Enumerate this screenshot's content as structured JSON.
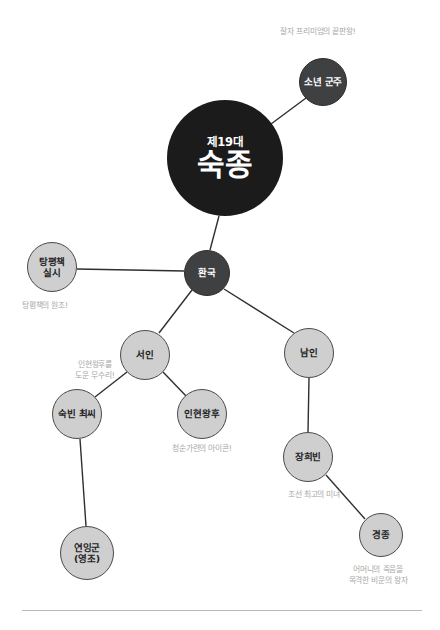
{
  "diagram": {
    "type": "mind-map",
    "colors": {
      "root_fill": "#1b1b1b",
      "dark_fill": "#3f4041",
      "light_fill": "#cfcfcf",
      "edge_stroke": "#2f2f2f",
      "annotation_text": "#a8a8a8",
      "rule": "#b9b9b9"
    },
    "root": {
      "generation_label": "제19대",
      "name_label": "숙종"
    },
    "nodes": [
      {
        "id": "sonyeon-gunju",
        "label": "소년 군주",
        "style": "dark",
        "cx": 323,
        "cy": 82,
        "r": 24
      },
      {
        "id": "sukjong",
        "label": "제19대 숙종",
        "style": "root",
        "cx": 225,
        "cy": 158,
        "r": 58
      },
      {
        "id": "hwanguk",
        "label": "환국",
        "style": "dark",
        "cx": 207,
        "cy": 273,
        "r": 23
      },
      {
        "id": "tangpyeong",
        "label": "탕평책\n실시",
        "style": "light",
        "cx": 52,
        "cy": 267,
        "r": 25
      },
      {
        "id": "seoin",
        "label": "서인",
        "style": "light",
        "cx": 145,
        "cy": 355,
        "r": 25
      },
      {
        "id": "namin",
        "label": "남인",
        "style": "light",
        "cx": 309,
        "cy": 353,
        "r": 25
      },
      {
        "id": "sukbin-choe",
        "label": "숙빈 최씨",
        "style": "light",
        "cx": 77,
        "cy": 414,
        "r": 25
      },
      {
        "id": "inhyeon",
        "label": "인현왕후",
        "style": "light",
        "cx": 202,
        "cy": 414,
        "r": 25
      },
      {
        "id": "janghuibin",
        "label": "장희빈",
        "style": "light",
        "cx": 308,
        "cy": 457,
        "r": 25
      },
      {
        "id": "gyeongjong",
        "label": "경종",
        "style": "light",
        "cx": 381,
        "cy": 535,
        "r": 22
      },
      {
        "id": "yeoninggun",
        "label": "연잉군\n(영조)",
        "style": "light",
        "cx": 87,
        "cy": 553,
        "r": 27
      }
    ],
    "edges": [
      {
        "id": "edge-sukjong-sonyeon",
        "from": "sukjong",
        "to": "sonyeon-gunju",
        "x1": 271,
        "y1": 124,
        "x2": 306,
        "y2": 98
      },
      {
        "id": "edge-sukjong-hwanguk",
        "from": "sukjong",
        "to": "hwanguk",
        "x1": 219,
        "y1": 216,
        "x2": 210,
        "y2": 250
      },
      {
        "id": "edge-hwanguk-tangpyeong",
        "from": "hwanguk",
        "to": "tangpyeong",
        "x1": 184,
        "y1": 271,
        "x2": 77,
        "y2": 269
      },
      {
        "id": "edge-hwanguk-seoin",
        "from": "hwanguk",
        "to": "seoin",
        "x1": 192,
        "y1": 290,
        "x2": 159,
        "y2": 333
      },
      {
        "id": "edge-hwanguk-namin",
        "from": "hwanguk",
        "to": "namin",
        "x1": 224,
        "y1": 289,
        "x2": 294,
        "y2": 333
      },
      {
        "id": "edge-seoin-sukbin",
        "from": "seoin",
        "to": "sukbin-choe",
        "x1": 127,
        "y1": 372,
        "x2": 95,
        "y2": 397
      },
      {
        "id": "edge-seoin-inhyeon",
        "from": "seoin",
        "to": "inhyeon",
        "x1": 163,
        "y1": 372,
        "x2": 187,
        "y2": 397
      },
      {
        "id": "edge-namin-janghuibin",
        "from": "namin",
        "to": "janghuibin",
        "x1": 309,
        "y1": 378,
        "x2": 308,
        "y2": 432
      },
      {
        "id": "edge-janghuibin-gyeongjong",
        "from": "janghuibin",
        "to": "gyeongjong",
        "x1": 326,
        "y1": 475,
        "x2": 365,
        "y2": 519
      },
      {
        "id": "edge-sukbin-yeoninggun",
        "from": "sukbin-choe",
        "to": "yeoninggun",
        "x1": 80,
        "y1": 439,
        "x2": 86,
        "y2": 526
      }
    ],
    "annotations": [
      {
        "id": "ann-sonyeon",
        "for": "sonyeon-gunju",
        "text": "잘자 프리미엄의 끝판왕!",
        "x": 262,
        "y": 26,
        "width": 112,
        "align": "center"
      },
      {
        "id": "ann-tangpyeong",
        "for": "tangpyeong",
        "text": "탕평책의 원조!",
        "x": 22,
        "y": 300,
        "width": 80,
        "align": "left"
      },
      {
        "id": "ann-sukbin",
        "for": "sukbin-choe",
        "text": "인현왕후를\n도운 무수리!",
        "x": 55,
        "y": 359,
        "width": 80,
        "align": "center"
      },
      {
        "id": "ann-inhyeon",
        "for": "inhyeon",
        "text": "청순가련의 아이콘!",
        "x": 152,
        "y": 443,
        "width": 100,
        "align": "center"
      },
      {
        "id": "ann-janghuibin",
        "for": "janghuibin",
        "text": "조선 최고의 미녀",
        "x": 272,
        "y": 489,
        "width": 84,
        "align": "center"
      },
      {
        "id": "ann-gyeongjong",
        "for": "gyeongjong",
        "text": "어머니의 죽음을\n목격한 비운의 왕자",
        "x": 325,
        "y": 564,
        "width": 106,
        "align": "center"
      }
    ],
    "footer_rule": {
      "x": 22,
      "y": 610,
      "width": 400
    }
  }
}
